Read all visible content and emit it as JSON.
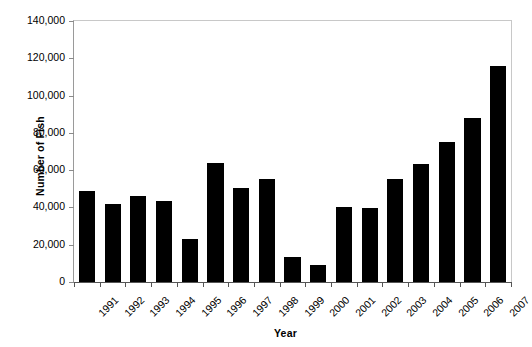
{
  "chart_data": {
    "type": "bar",
    "title": "",
    "xlabel": "Year",
    "ylabel": "Number of Fish",
    "categories": [
      "1991",
      "1992",
      "1993",
      "1994",
      "1995",
      "1996",
      "1997",
      "1998",
      "1999",
      "2000",
      "2001",
      "2002",
      "2003",
      "2004",
      "2005",
      "2006",
      "2007"
    ],
    "values": [
      49000,
      42000,
      46000,
      43500,
      23000,
      64000,
      50500,
      55000,
      13500,
      9000,
      40500,
      39500,
      55500,
      63500,
      75000,
      88000,
      116000
    ],
    "ylim": [
      0,
      140000
    ],
    "ytick_values": [
      0,
      20000,
      40000,
      60000,
      80000,
      100000,
      120000,
      140000
    ],
    "ytick_labels": [
      "0",
      "20,000",
      "40,000",
      "60,000",
      "80,000",
      "100,000",
      "120,000",
      "140,000"
    ],
    "grid": false,
    "legend": false,
    "bar_color": "#000000",
    "axis_color": "#555555",
    "background": "#ffffff"
  }
}
